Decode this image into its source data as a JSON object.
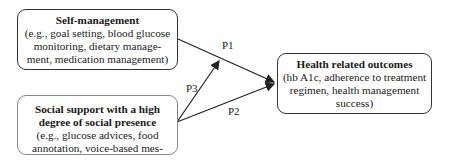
{
  "nodes": {
    "self_management": {
      "title": "Self-management",
      "lines": [
        "(e.g., goal setting, blood glucose",
        "monitoring, dietary manage-",
        "ment, medication management)"
      ]
    },
    "social_support": {
      "title_lines": [
        "Social support with a high",
        "degree of social presence"
      ],
      "lines": [
        "(e.g., glucose advices, food",
        "annotation, voice-based mes-"
      ]
    },
    "health_outcomes": {
      "title": "Health related outcomes",
      "lines": [
        "(hb A1c, adherence to treatment",
        "regimen, health management",
        "success)"
      ]
    }
  },
  "edges": [
    {
      "label": "P1",
      "from": "self_management",
      "to": "health_outcomes"
    },
    {
      "label": "P2",
      "from": "social_support",
      "to": "health_outcomes"
    },
    {
      "label": "P3",
      "from": "social_support",
      "to": "edge_P1"
    }
  ],
  "colors": {
    "stroke": "#222222",
    "text": "#1a1a1a"
  }
}
